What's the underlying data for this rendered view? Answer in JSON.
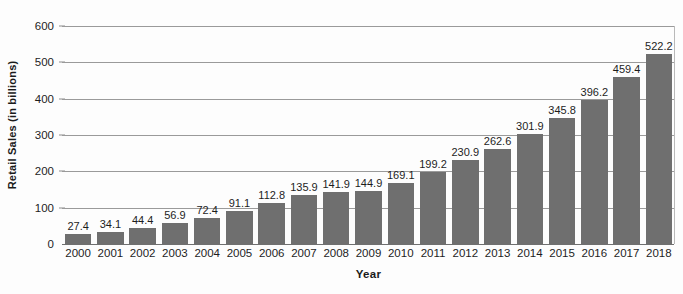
{
  "chart_data": {
    "type": "bar",
    "title": "",
    "xlabel": "Year",
    "ylabel": "Retail Sales (in billions)",
    "categories": [
      "2000",
      "2001",
      "2002",
      "2003",
      "2004",
      "2005",
      "2006",
      "2007",
      "2008",
      "2009",
      "2010",
      "2011",
      "2012",
      "2013",
      "2014",
      "2015",
      "2016",
      "2017",
      "2018"
    ],
    "values": [
      27.4,
      34.1,
      44.4,
      56.9,
      72.4,
      91.1,
      112.8,
      135.9,
      141.9,
      144.9,
      169.1,
      199.2,
      230.9,
      262.6,
      301.9,
      345.8,
      396.2,
      459.4,
      522.2
    ],
    "value_labels": [
      "27.4",
      "34.1",
      "44.4",
      "56.9",
      "72.4",
      "91.1",
      "112.8",
      "135.9",
      "141.9",
      "144.9",
      "169.1",
      "199.2",
      "230.9",
      "262.6",
      "301.9",
      "345.8",
      "396.2",
      "459.4",
      "522.2"
    ],
    "ylim": [
      0,
      600
    ],
    "yticks": [
      0,
      100,
      200,
      300,
      400,
      500,
      600
    ],
    "ytick_labels": [
      "0",
      "100",
      "200",
      "300",
      "400",
      "500",
      "600"
    ],
    "grid": true,
    "legend": "none",
    "series_name": "Retail Sales",
    "bar_color": "#6f6f6f",
    "gridline_color": "#9a9a9a",
    "axis_color": "#6f6f6f",
    "text_color": "#1d1d1d",
    "background_color": "#fdfdfd"
  }
}
